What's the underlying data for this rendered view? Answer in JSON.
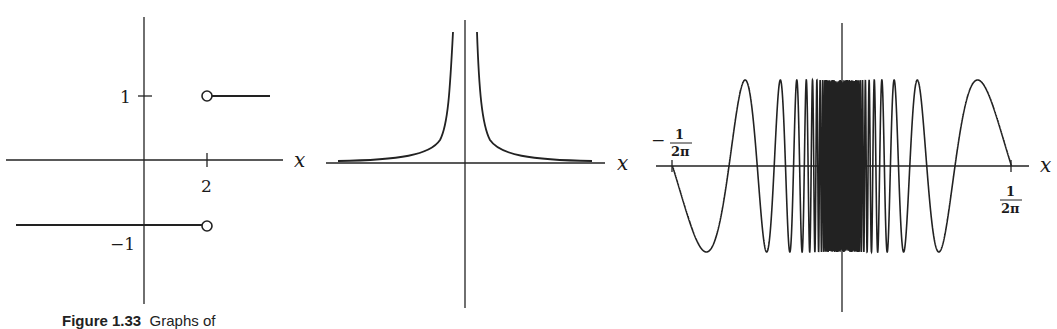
{
  "caption": {
    "label": "Figure 1.33",
    "text": "Graphs of"
  },
  "panels": [
    {
      "name": "step-function",
      "x_label": "x",
      "y_ticks": [
        "1",
        "−1"
      ],
      "x_ticks": [
        "2"
      ]
    },
    {
      "name": "reciprocal-abs-function",
      "x_label": "x"
    },
    {
      "name": "sin-one-over-x",
      "x_label": "x",
      "left_endpoint": {
        "sign": "−",
        "num": "1",
        "den": "2π"
      },
      "right_endpoint": {
        "num": "1",
        "den": "2π"
      }
    }
  ],
  "chart_data": [
    {
      "type": "line",
      "title": "Step function (jump at x = 2)",
      "xlabel": "x",
      "ylabel": "",
      "x_ticks": [
        2
      ],
      "y_ticks": [
        1,
        -1
      ],
      "series": [
        {
          "name": "y=-1 for x<2",
          "x": [
            -2.3,
            2
          ],
          "values": [
            -1,
            -1
          ],
          "open_end": true
        },
        {
          "name": "y=1 for x>2",
          "x": [
            2,
            3
          ],
          "values": [
            1,
            1
          ],
          "open_start": true
        }
      ]
    },
    {
      "type": "line",
      "title": "Curve with vertical asymptote at x = 0",
      "xlabel": "x",
      "ylabel": "",
      "series": [
        {
          "name": "f(x) → ∞ as x → 0, → 0 as |x| → ∞"
        }
      ]
    },
    {
      "type": "line",
      "title": "sin(1/x) on [-1/(2π), 1/(2π)]",
      "xlabel": "x",
      "ylabel": "",
      "x_ticks": [
        "-1/(2π)",
        "1/(2π)"
      ],
      "ylim": [
        -1,
        1
      ]
    }
  ]
}
